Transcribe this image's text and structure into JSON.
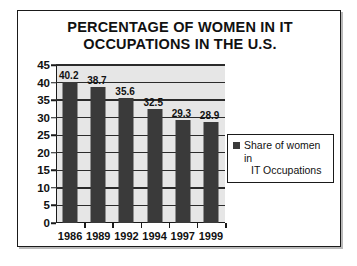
{
  "chart_data": {
    "type": "bar",
    "title": "PERCENTAGE OF WOMEN IN IT OCCUPATIONS IN THE U.S.",
    "title_line1": "PERCENTAGE OF WOMEN IN IT",
    "title_line2": "OCCUPATIONS IN THE U.S.",
    "categories": [
      "1986",
      "1989",
      "1992",
      "1994",
      "1997",
      "1999"
    ],
    "values": [
      40.2,
      38.7,
      35.6,
      32.5,
      29.3,
      28.9
    ],
    "value_labels": [
      "40.2",
      "38.7",
      "35.6",
      "32.5",
      "29.3",
      "28.9"
    ],
    "series": [
      {
        "name": "Share of women in IT Occupations",
        "values": [
          40.2,
          38.7,
          35.6,
          32.5,
          29.3,
          28.9
        ],
        "color": "#3a3a3a"
      }
    ],
    "xlabel": "",
    "ylabel": "",
    "ylim": [
      0,
      45
    ],
    "ytick_step": 5,
    "yticks": [
      "0",
      "5",
      "10",
      "15",
      "20",
      "25",
      "30",
      "35",
      "40",
      "45"
    ],
    "grid": true,
    "grid_axis": "y",
    "legend_position": "right",
    "plot_background": "#e6e6e6",
    "bar_color": "#3a3a3a",
    "axis_color": "#1a1a1a"
  },
  "legend": {
    "entries": [
      {
        "label": "Share of women in IT Occupations",
        "label_line1": "Share of women in",
        "label_line2": "IT Occupations",
        "color": "#3a3a3a"
      }
    ]
  }
}
